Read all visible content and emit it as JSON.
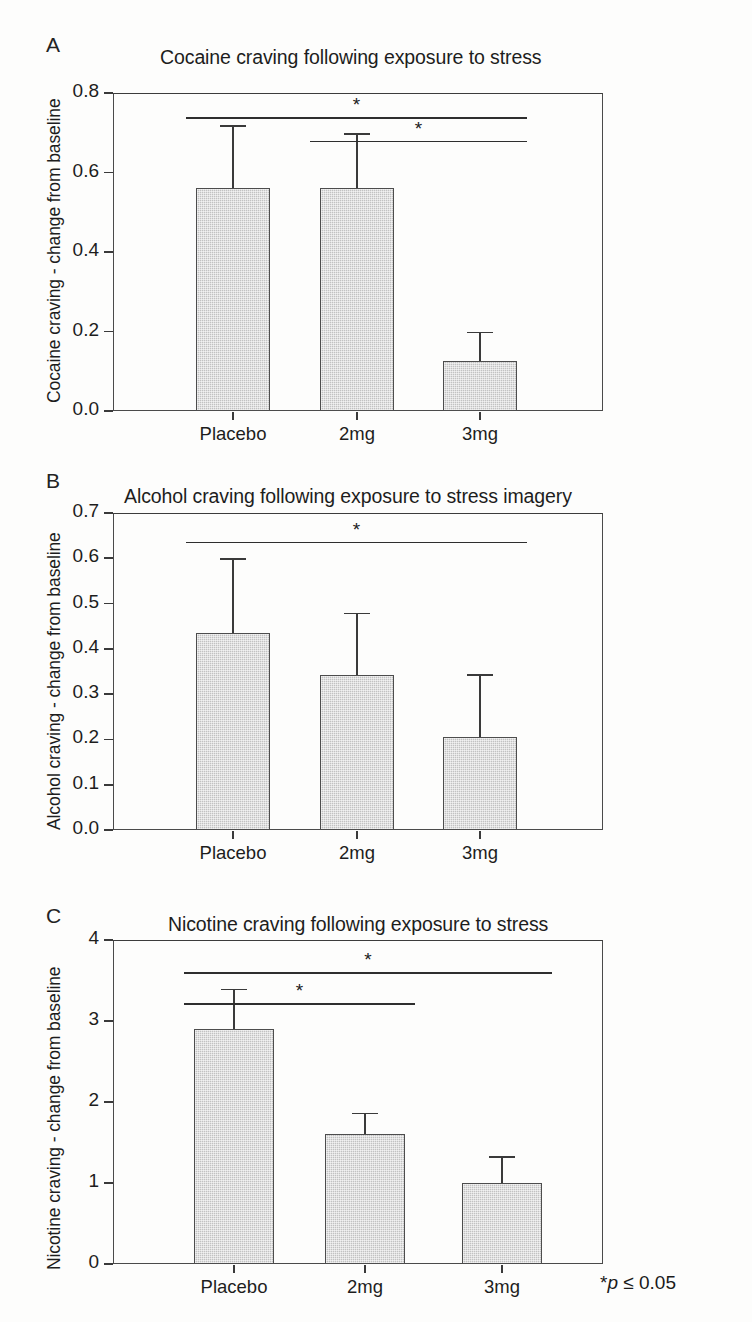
{
  "figure": {
    "footnote_star": "*",
    "footnote_p": "p",
    "footnote_rest": " ≤ 0.05",
    "footnote_full": "*p ≤ 0.05",
    "bar_fill_color": "#c2c2c2",
    "line_color": "#3a3a3a",
    "text_color": "#1d1d1d"
  },
  "chart_data": [
    {
      "type": "bar",
      "panel": "A",
      "title": "Cocaine craving following exposure to stress",
      "xlabel": "",
      "ylabel": "Cocaine craving - change from baseline",
      "categories": [
        "Placebo",
        "2mg",
        "3mg"
      ],
      "values": [
        0.56,
        0.56,
        0.125
      ],
      "errors_upper": [
        0.72,
        0.7,
        0.2
      ],
      "ylim": [
        0.0,
        0.8
      ],
      "yticks": [
        0.0,
        0.2,
        0.4,
        0.6,
        0.8
      ],
      "ytick_labels": [
        "0.0",
        "0.2",
        "0.4",
        "0.6",
        "0.8"
      ],
      "grid": false,
      "legend": "none",
      "annotations": [
        {
          "label": "*",
          "from": "Placebo",
          "to": "3mg",
          "y": 0.74
        },
        {
          "label": "*",
          "from": "2mg",
          "to": "3mg",
          "y": 0.68
        }
      ]
    },
    {
      "type": "bar",
      "panel": "B",
      "title": "Alcohol craving following exposure to stress imagery",
      "xlabel": "",
      "ylabel": "Alcohol craving - change from baseline",
      "categories": [
        "Placebo",
        "2mg",
        "3mg"
      ],
      "values": [
        0.435,
        0.343,
        0.205
      ],
      "errors_upper": [
        0.6,
        0.48,
        0.345
      ],
      "ylim": [
        0.0,
        0.7
      ],
      "yticks": [
        0.0,
        0.1,
        0.2,
        0.3,
        0.4,
        0.5,
        0.6,
        0.7
      ],
      "ytick_labels": [
        "0.0",
        "0.1",
        "0.2",
        "0.3",
        "0.4",
        "0.5",
        "0.6",
        "0.7"
      ],
      "grid": false,
      "legend": "none",
      "annotations": [
        {
          "label": "*",
          "from": "Placebo",
          "to": "3mg",
          "y": 0.637
        }
      ]
    },
    {
      "type": "bar",
      "panel": "C",
      "title": "Nicotine craving following exposure to stress",
      "xlabel": "",
      "ylabel": "Nicotine craving - change from baseline",
      "categories": [
        "Placebo",
        "2mg",
        "3mg"
      ],
      "values": [
        2.9,
        1.6,
        1.0
      ],
      "errors_upper": [
        3.4,
        1.87,
        1.33
      ],
      "ylim": [
        0,
        4
      ],
      "yticks": [
        0,
        1,
        2,
        3,
        4
      ],
      "ytick_labels": [
        "0",
        "1",
        "2",
        "3",
        "4"
      ],
      "grid": false,
      "legend": "none",
      "annotations": [
        {
          "label": "*",
          "from": "Placebo",
          "to": "3mg",
          "y": 3.6
        },
        {
          "label": "*",
          "from": "Placebo",
          "to": "2mg",
          "y": 3.22
        }
      ]
    }
  ]
}
